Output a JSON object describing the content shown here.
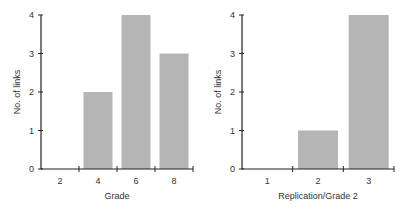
{
  "chart_data": [
    {
      "type": "bar",
      "title": "",
      "xlabel": "Grade",
      "ylabel": "No. of links",
      "categories": [
        "2",
        "4",
        "6",
        "8"
      ],
      "values": [
        0,
        2,
        4,
        3
      ],
      "ylim": [
        0,
        4
      ],
      "yticks": [
        "0",
        "1",
        "2",
        "3",
        "4"
      ],
      "grid": false,
      "bar_color": "#b5b5b5"
    },
    {
      "type": "bar",
      "title": "",
      "xlabel": "Replication/Grade 2",
      "ylabel": "No. of links",
      "categories": [
        "1",
        "2",
        "3"
      ],
      "values": [
        0,
        1,
        4
      ],
      "ylim": [
        0,
        4
      ],
      "yticks": [
        "0",
        "1",
        "2",
        "3",
        "4"
      ],
      "grid": false,
      "bar_color": "#b5b5b5"
    }
  ]
}
